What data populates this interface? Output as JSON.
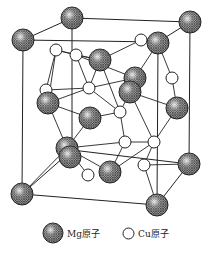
{
  "diagram": {
    "type": "crystal-structure",
    "colors": {
      "line": "#222222",
      "mg_fill": "#8a8a8a",
      "cu_fill": "#ffffff"
    },
    "cell_edges": [
      [
        72,
        18,
        190,
        22
      ],
      [
        23,
        40,
        72,
        18
      ],
      [
        23,
        40,
        22,
        194
      ],
      [
        190,
        22,
        189,
        164
      ],
      [
        22,
        194,
        157,
        205
      ],
      [
        157,
        205,
        189,
        164
      ],
      [
        72,
        18,
        72,
        150
      ],
      [
        72,
        150,
        189,
        164
      ],
      [
        23,
        40,
        158,
        42
      ],
      [
        158,
        42,
        190,
        22
      ],
      [
        158,
        42,
        157,
        205
      ],
      [
        72,
        150,
        22,
        194
      ]
    ],
    "bonds": [
      [
        56,
        50,
        76,
        55
      ],
      [
        56,
        50,
        48,
        103
      ],
      [
        76,
        55,
        100,
        60
      ],
      [
        76,
        55,
        89,
        88
      ],
      [
        100,
        60,
        141,
        40
      ],
      [
        141,
        40,
        158,
        43
      ],
      [
        158,
        43,
        172,
        78
      ],
      [
        172,
        78,
        177,
        108
      ],
      [
        100,
        60,
        89,
        88
      ],
      [
        89,
        88,
        135,
        78
      ],
      [
        135,
        78,
        158,
        43
      ],
      [
        135,
        78,
        130,
        92
      ],
      [
        46,
        90,
        89,
        88
      ],
      [
        46,
        90,
        56,
        50
      ],
      [
        48,
        103,
        89,
        88
      ],
      [
        89,
        88,
        120,
        112
      ],
      [
        120,
        112,
        130,
        92
      ],
      [
        120,
        112,
        90,
        118
      ],
      [
        90,
        118,
        48,
        103
      ],
      [
        90,
        118,
        67,
        148
      ],
      [
        120,
        112,
        125,
        142
      ],
      [
        125,
        142,
        154,
        142
      ],
      [
        154,
        142,
        177,
        108
      ],
      [
        154,
        142,
        144,
        165
      ],
      [
        125,
        142,
        110,
        172
      ],
      [
        144,
        165,
        157,
        205
      ],
      [
        144,
        165,
        189,
        164
      ],
      [
        67,
        148,
        110,
        172
      ],
      [
        67,
        148,
        22,
        194
      ],
      [
        88,
        175,
        67,
        148
      ],
      [
        130,
        92,
        154,
        142
      ],
      [
        100,
        60,
        120,
        112
      ],
      [
        56,
        50,
        100,
        60
      ],
      [
        76,
        55,
        135,
        78
      ],
      [
        67,
        148,
        125,
        142
      ],
      [
        110,
        172,
        154,
        142
      ],
      [
        130,
        92,
        177,
        108
      ],
      [
        48,
        103,
        67,
        148
      ]
    ],
    "atoms_mg": [
      [
        72,
        18
      ],
      [
        190,
        22
      ],
      [
        23,
        40
      ],
      [
        100,
        60
      ],
      [
        158,
        43
      ],
      [
        135,
        78
      ],
      [
        130,
        92
      ],
      [
        177,
        108
      ],
      [
        48,
        103
      ],
      [
        90,
        118
      ],
      [
        67,
        148
      ],
      [
        70,
        157
      ],
      [
        22,
        194
      ],
      [
        189,
        164
      ],
      [
        157,
        205
      ],
      [
        110,
        172
      ]
    ],
    "atoms_cu": [
      [
        56,
        50
      ],
      [
        76,
        55
      ],
      [
        141,
        40
      ],
      [
        172,
        78
      ],
      [
        89,
        88
      ],
      [
        46,
        90
      ],
      [
        120,
        112
      ],
      [
        125,
        142
      ],
      [
        154,
        142
      ],
      [
        144,
        165
      ],
      [
        88,
        175
      ]
    ]
  },
  "legend": {
    "mg_label": "Mg原子",
    "cu_label": "Cu原子"
  }
}
